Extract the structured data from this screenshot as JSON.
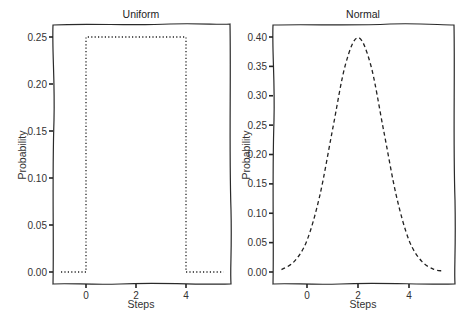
{
  "chart_data": [
    {
      "type": "line",
      "title": "Uniform",
      "xlabel": "Steps",
      "ylabel": "Probability",
      "xticks": [
        "0",
        "2",
        "4"
      ],
      "yticks": [
        "0.00",
        "0.05",
        "0.10",
        "0.15",
        "0.20",
        "0.25"
      ],
      "xlim": [
        -1.3,
        5.8
      ],
      "ylim": [
        -0.013,
        0.263
      ],
      "line_style": "dotted",
      "series": [
        {
          "name": "Uniform",
          "x": [
            -1,
            -0.5,
            0,
            0,
            1,
            2,
            3,
            4,
            4,
            4.5,
            5,
            5.5
          ],
          "y": [
            0,
            0,
            0,
            0.25,
            0.25,
            0.25,
            0.25,
            0.25,
            0,
            0,
            0,
            0
          ]
        }
      ],
      "grid": false
    },
    {
      "type": "line",
      "title": "Normal",
      "xlabel": "Steps",
      "ylabel": "Probability",
      "xticks": [
        "0",
        "2",
        "4"
      ],
      "yticks": [
        "0.00",
        "0.05",
        "0.10",
        "0.15",
        "0.20",
        "0.25",
        "0.30",
        "0.35",
        "0.40"
      ],
      "xlim": [
        -1.35,
        5.75
      ],
      "ylim": [
        -0.02,
        0.42
      ],
      "line_style": "dashed",
      "series": [
        {
          "name": "Normal",
          "x": [
            -1,
            -0.5,
            0,
            0.5,
            1,
            1.5,
            2,
            2.5,
            3,
            3.5,
            4,
            4.5,
            5,
            5.3
          ],
          "y": [
            0.004,
            0.018,
            0.054,
            0.13,
            0.242,
            0.352,
            0.399,
            0.352,
            0.242,
            0.13,
            0.054,
            0.018,
            0.004,
            0.002
          ]
        }
      ],
      "grid": false
    }
  ],
  "panels": [
    {
      "title": "Uniform",
      "xlabel": "Steps",
      "ylabel": "Probability",
      "xticks": [
        {
          "v": 0,
          "label": "0"
        },
        {
          "v": 2,
          "label": "2"
        },
        {
          "v": 4,
          "label": "4"
        }
      ],
      "yticks": [
        {
          "v": 0.0,
          "label": "0.00"
        },
        {
          "v": 0.05,
          "label": "0.05"
        },
        {
          "v": 0.1,
          "label": "0.10"
        },
        {
          "v": 0.15,
          "label": "0.15"
        },
        {
          "v": 0.2,
          "label": "0.20"
        },
        {
          "v": 0.25,
          "label": "0.25"
        }
      ]
    },
    {
      "title": "Normal",
      "xlabel": "Steps",
      "ylabel": "Probability",
      "xticks": [
        {
          "v": 0,
          "label": "0"
        },
        {
          "v": 2,
          "label": "2"
        },
        {
          "v": 4,
          "label": "4"
        }
      ],
      "yticks": [
        {
          "v": 0.0,
          "label": "0.00"
        },
        {
          "v": 0.05,
          "label": "0.05"
        },
        {
          "v": 0.1,
          "label": "0.10"
        },
        {
          "v": 0.15,
          "label": "0.15"
        },
        {
          "v": 0.2,
          "label": "0.20"
        },
        {
          "v": 0.25,
          "label": "0.25"
        },
        {
          "v": 0.3,
          "label": "0.30"
        },
        {
          "v": 0.35,
          "label": "0.35"
        },
        {
          "v": 0.4,
          "label": "0.40"
        }
      ]
    }
  ],
  "colors": {
    "line": "#222222",
    "frame": "#2a2a2a",
    "text": "#333333",
    "background": "#ffffff"
  }
}
